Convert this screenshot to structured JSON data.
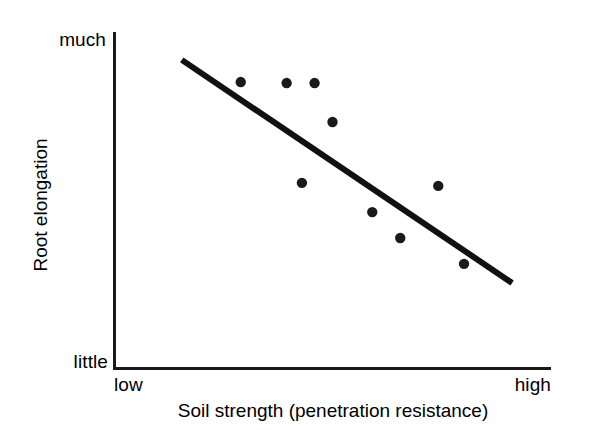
{
  "chart_data": {
    "type": "scatter",
    "title": "",
    "subtitle": "",
    "xlabel": "Soil strength (penetration resistance)",
    "ylabel": "Root elongation",
    "xtick_labels": [
      "low",
      "high"
    ],
    "ytick_labels": [
      "little",
      "much"
    ],
    "xlim": [
      0,
      100
    ],
    "ylim": [
      0,
      100
    ],
    "grid": false,
    "legend": null,
    "annotations": [],
    "series": [
      {
        "name": "observations",
        "marker": "filled-circle",
        "color": "#1a1a1a",
        "points": [
          {
            "x": 29.0,
            "y": 85.1
          },
          {
            "x": 39.5,
            "y": 84.8
          },
          {
            "x": 45.9,
            "y": 84.8
          },
          {
            "x": 50.0,
            "y": 73.2
          },
          {
            "x": 43.0,
            "y": 55.1
          },
          {
            "x": 74.2,
            "y": 54.2
          },
          {
            "x": 59.1,
            "y": 46.4
          },
          {
            "x": 65.5,
            "y": 38.7
          },
          {
            "x": 80.1,
            "y": 31.0
          }
        ]
      },
      {
        "name": "trend-line",
        "type": "line",
        "color": "#111111",
        "points": [
          {
            "x": 15.5,
            "y": 91.7
          },
          {
            "x": 91.1,
            "y": 25.3
          }
        ]
      }
    ]
  },
  "axes": {
    "y": {
      "label": "Root elongation",
      "low_label": "little",
      "high_label": "much"
    },
    "x": {
      "label": "Soil strength (penetration resistance)",
      "low_label": "low",
      "high_label": "high"
    }
  },
  "colors": {
    "background": "#ffffff",
    "ink": "#1a1a1a",
    "line": "#111111",
    "marker": "#1a1a1a"
  }
}
